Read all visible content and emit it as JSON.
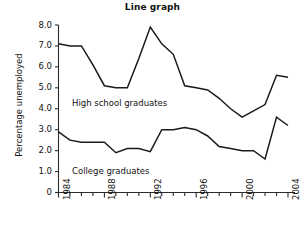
{
  "chart_data": {
    "type": "line",
    "title": "Line graph",
    "xlabel": "",
    "ylabel": "Percentage unemployed",
    "xlim": [
      1984,
      2004
    ],
    "ylim": [
      0,
      8
    ],
    "grid": false,
    "legend_position": "inline-annotation",
    "x": [
      1984,
      1985,
      1986,
      1987,
      1988,
      1989,
      1990,
      1991,
      1992,
      1993,
      1994,
      1995,
      1996,
      1997,
      1998,
      1999,
      2000,
      2001,
      2002,
      2003,
      2004
    ],
    "xtick_labels": [
      "1984",
      "1988",
      "1992",
      "1996",
      "2000",
      "2004"
    ],
    "xtick_label_values": [
      1984,
      1988,
      1992,
      1996,
      2000,
      2004
    ],
    "xticks_minor_every": 1,
    "ytick_labels": [
      "0",
      "1.0",
      "2.0",
      "3.0",
      "4.0",
      "5.0",
      "6.0",
      "7.0",
      "8.0"
    ],
    "ytick_values": [
      0,
      1,
      2,
      3,
      4,
      5,
      6,
      7,
      8
    ],
    "series": [
      {
        "name": "High school graduates",
        "color": "#1a1a1a",
        "label_text": "High school graduates",
        "values": [
          7.1,
          7.0,
          7.0,
          6.1,
          5.1,
          5.0,
          5.0,
          6.4,
          7.9,
          7.1,
          6.6,
          5.1,
          5.0,
          4.9,
          4.5,
          4.0,
          3.6,
          3.9,
          4.2,
          5.6,
          5.5
        ]
      },
      {
        "name": "College graduates",
        "color": "#1a1a1a",
        "label_text": "College graduates",
        "values": [
          2.9,
          2.5,
          2.4,
          2.4,
          2.4,
          1.9,
          2.1,
          2.1,
          1.95,
          3.0,
          3.0,
          3.1,
          3.0,
          2.7,
          2.2,
          2.1,
          2.0,
          2.0,
          1.6,
          2.15,
          2.15
        ]
      }
    ],
    "series_2_tail": [
      2003,
      3.6,
      2004,
      3.2
    ],
    "annotations": [
      {
        "text": "High school graduates",
        "x_pixel": 72,
        "y_pixel": 98
      },
      {
        "text": "College graduates",
        "x_pixel": 72,
        "y_pixel": 166
      }
    ]
  },
  "axes": {
    "y_axis_label": "Percentage unemployed",
    "title": "Line graph"
  }
}
